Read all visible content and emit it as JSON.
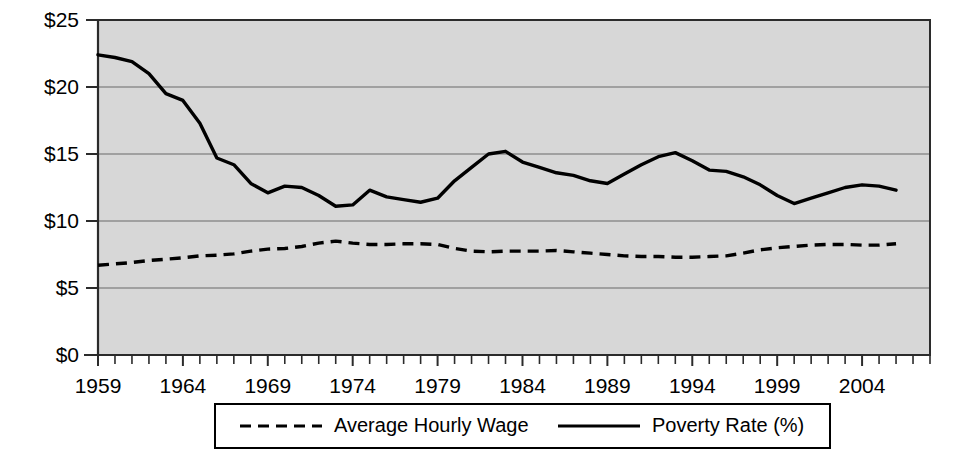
{
  "chart_data": {
    "type": "line",
    "title": "",
    "subtitle": "",
    "xlabel": "",
    "ylabel": "",
    "xlim": [
      1959,
      2008
    ],
    "ylim": [
      0,
      25
    ],
    "grid": true,
    "legend_position": "bottom",
    "y_ticks": [
      "$0",
      "$5",
      "$10",
      "$15",
      "$20",
      "$25"
    ],
    "y_tick_values": [
      0,
      5,
      10,
      15,
      20,
      25
    ],
    "x_ticks": [
      "1959",
      "1964",
      "1969",
      "1974",
      "1979",
      "1984",
      "1989",
      "1994",
      "1999",
      "2004"
    ],
    "x_tick_values": [
      1959,
      1964,
      1969,
      1974,
      1979,
      1984,
      1989,
      1994,
      1999,
      2004
    ],
    "x": [
      1959,
      1960,
      1961,
      1962,
      1963,
      1964,
      1965,
      1966,
      1967,
      1968,
      1969,
      1970,
      1971,
      1972,
      1973,
      1974,
      1975,
      1976,
      1977,
      1978,
      1979,
      1980,
      1981,
      1982,
      1983,
      1984,
      1985,
      1986,
      1987,
      1988,
      1989,
      1990,
      1991,
      1992,
      1993,
      1994,
      1995,
      1996,
      1997,
      1998,
      1999,
      2000,
      2001,
      2002,
      2003,
      2004,
      2005,
      2006
    ],
    "series": [
      {
        "name": "Poverty Rate (%)",
        "style": "solid",
        "values": [
          22.4,
          22.2,
          21.9,
          21.0,
          19.5,
          19.0,
          17.3,
          14.7,
          14.2,
          12.8,
          12.1,
          12.6,
          12.5,
          11.9,
          11.1,
          11.2,
          12.3,
          11.8,
          11.6,
          11.4,
          11.7,
          13.0,
          14.0,
          15.0,
          15.2,
          14.4,
          14.0,
          13.6,
          13.4,
          13.0,
          12.8,
          13.5,
          14.2,
          14.8,
          15.1,
          14.5,
          13.8,
          13.7,
          13.3,
          12.7,
          11.9,
          11.3,
          11.7,
          12.1,
          12.5,
          12.7,
          12.6,
          12.3
        ]
      },
      {
        "name": "Average Hourly Wage",
        "style": "dashed",
        "values": [
          6.7,
          6.8,
          6.9,
          7.05,
          7.15,
          7.25,
          7.4,
          7.45,
          7.55,
          7.75,
          7.9,
          7.95,
          8.1,
          8.35,
          8.5,
          8.35,
          8.25,
          8.25,
          8.3,
          8.3,
          8.25,
          7.95,
          7.75,
          7.7,
          7.75,
          7.75,
          7.75,
          7.8,
          7.7,
          7.6,
          7.5,
          7.4,
          7.35,
          7.35,
          7.3,
          7.3,
          7.35,
          7.4,
          7.6,
          7.85,
          8.0,
          8.1,
          8.2,
          8.25,
          8.25,
          8.2,
          8.2,
          8.3
        ]
      }
    ],
    "legend": [
      {
        "label": "Average Hourly Wage",
        "style": "dashed"
      },
      {
        "label": "Poverty Rate (%)",
        "style": "solid"
      }
    ],
    "colors": {
      "plot_background": "#d7d7d7",
      "line": "#000000",
      "gridline": "#6b6b6b",
      "axis": "#2b2b2b",
      "page_background": "#ffffff"
    }
  }
}
